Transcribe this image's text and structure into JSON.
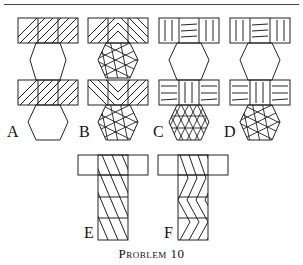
{
  "figure": {
    "caption": "Problem 10",
    "labels": {
      "a": "A",
      "b": "B",
      "c": "C",
      "d": "D",
      "e": "E",
      "f": "F"
    },
    "items": [
      {
        "label": "A",
        "description": "Two rectangles with parallel diagonal hatching joined by plain hexagons"
      },
      {
        "label": "B",
        "description": "Rectangles with chevron hatching joined by hexagons with star-lattice pattern"
      },
      {
        "label": "C",
        "description": "Rectangles with vertical/horizontal line blocks joined by hexagon with triangular grid"
      },
      {
        "label": "D",
        "description": "Rectangles with vertical/horizontal line blocks joined by hexagon with star-lattice pattern"
      },
      {
        "label": "E",
        "description": "T-shape with parallel diagonal hatching"
      },
      {
        "label": "F",
        "description": "T-shape with zigzag chevron hatching"
      }
    ]
  }
}
